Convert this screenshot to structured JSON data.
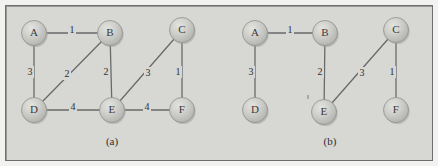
{
  "figure": {
    "background_color": "#d7d7d4",
    "border_color": "#6e6e6e",
    "node_fill": "#c9c9c6",
    "edge_color": "#6a6a6a",
    "subfigures": [
      {
        "caption": "(a)",
        "caption_x": 112,
        "caption_y": 142,
        "nodes": [
          {
            "id": "A",
            "label": "A",
            "x": 34,
            "y": 33,
            "r": 12.5
          },
          {
            "id": "B",
            "label": "B",
            "x": 110,
            "y": 33,
            "r": 12.5
          },
          {
            "id": "C",
            "label": "C",
            "x": 182,
            "y": 30,
            "r": 12.5
          },
          {
            "id": "D",
            "label": "D",
            "x": 34,
            "y": 110,
            "r": 12.5
          },
          {
            "id": "E",
            "label": "E",
            "x": 112,
            "y": 110,
            "r": 12.5
          },
          {
            "id": "F",
            "label": "F",
            "x": 182,
            "y": 110,
            "r": 12.5
          }
        ],
        "edges": [
          {
            "from": "A",
            "to": "B",
            "weight": "1",
            "lx": 72,
            "ly": 30
          },
          {
            "from": "A",
            "to": "D",
            "weight": "3",
            "lx": 30,
            "ly": 72
          },
          {
            "from": "B",
            "to": "D",
            "weight": "2",
            "lx": 67,
            "ly": 74
          },
          {
            "from": "B",
            "to": "E",
            "weight": "2",
            "lx": 106,
            "ly": 72
          },
          {
            "from": "C",
            "to": "E",
            "weight": "3",
            "lx": 148,
            "ly": 73
          },
          {
            "from": "C",
            "to": "F",
            "weight": "1",
            "lx": 178,
            "ly": 72
          },
          {
            "from": "D",
            "to": "E",
            "weight": "4",
            "lx": 73,
            "ly": 107
          },
          {
            "from": "E",
            "to": "F",
            "weight": "4",
            "lx": 147,
            "ly": 107
          }
        ]
      },
      {
        "caption": "(b)",
        "caption_x": 330,
        "caption_y": 142,
        "nodes": [
          {
            "id": "A",
            "label": "A",
            "x": 255,
            "y": 33,
            "r": 12.5
          },
          {
            "id": "B",
            "label": "B",
            "x": 325,
            "y": 33,
            "r": 12.5
          },
          {
            "id": "C",
            "label": "C",
            "x": 396,
            "y": 30,
            "r": 12.5
          },
          {
            "id": "D",
            "label": "D",
            "x": 255,
            "y": 110,
            "r": 12.5
          },
          {
            "id": "E",
            "label": "E",
            "x": 324,
            "y": 112,
            "r": 12.5
          },
          {
            "id": "F",
            "label": "F",
            "x": 396,
            "y": 110,
            "r": 12.5
          }
        ],
        "edges": [
          {
            "from": "A",
            "to": "B",
            "weight": "1",
            "lx": 290,
            "ly": 30
          },
          {
            "from": "A",
            "to": "D",
            "weight": "3",
            "lx": 251,
            "ly": 72
          },
          {
            "from": "B",
            "to": "E",
            "weight": "2",
            "lx": 320,
            "ly": 72
          },
          {
            "from": "C",
            "to": "E",
            "weight": "3",
            "lx": 362,
            "ly": 73
          },
          {
            "from": "C",
            "to": "F",
            "weight": "1",
            "lx": 392,
            "ly": 72
          }
        ],
        "tick_marks": [
          {
            "x1": 308,
            "y1": 95,
            "x2": 308,
            "y2": 99
          }
        ]
      }
    ]
  },
  "chart_data": {
    "type": "diagram",
    "subfigures": [
      {
        "name": "(a)",
        "description": "Original weighted graph",
        "vertices": [
          "A",
          "B",
          "C",
          "D",
          "E",
          "F"
        ],
        "edges": [
          {
            "u": "A",
            "v": "B",
            "w": 1
          },
          {
            "u": "A",
            "v": "D",
            "w": 3
          },
          {
            "u": "B",
            "v": "D",
            "w": 2
          },
          {
            "u": "B",
            "v": "E",
            "w": 2
          },
          {
            "u": "C",
            "v": "E",
            "w": 3
          },
          {
            "u": "C",
            "v": "F",
            "w": 1
          },
          {
            "u": "D",
            "v": "E",
            "w": 4
          },
          {
            "u": "E",
            "v": "F",
            "w": 4
          }
        ]
      },
      {
        "name": "(b)",
        "description": "Spanning subgraph",
        "vertices": [
          "A",
          "B",
          "C",
          "D",
          "E",
          "F"
        ],
        "edges": [
          {
            "u": "A",
            "v": "B",
            "w": 1
          },
          {
            "u": "A",
            "v": "D",
            "w": 3
          },
          {
            "u": "B",
            "v": "E",
            "w": 2
          },
          {
            "u": "C",
            "v": "E",
            "w": 3
          },
          {
            "u": "C",
            "v": "F",
            "w": 1
          }
        ]
      }
    ]
  }
}
